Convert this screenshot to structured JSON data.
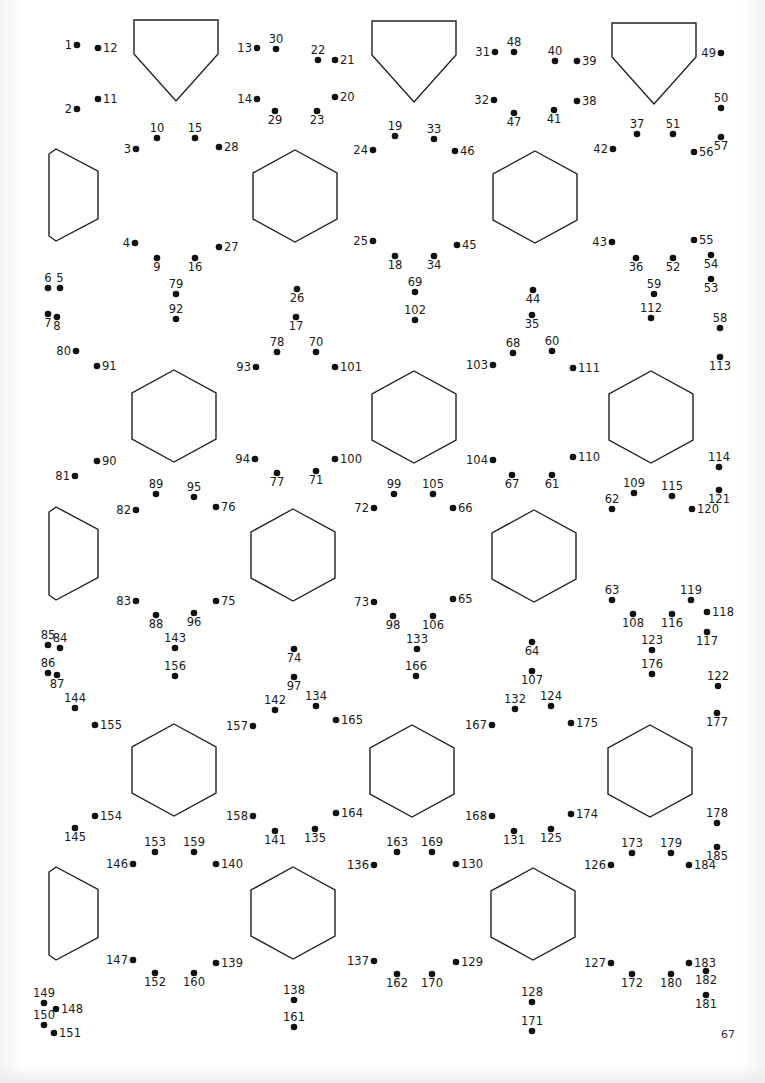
{
  "page": {
    "type": "connect-the-dots puzzle page",
    "page_number": "67",
    "ink_color": "#111111",
    "background_color": "#ffffff"
  },
  "outline_shapes": {
    "pentagons": 3,
    "half_hexagons_left_edge": 3,
    "hexagons": 12
  },
  "dots": [
    "1",
    "2",
    "3",
    "4",
    "5",
    "6",
    "7",
    "8",
    "9",
    "10",
    "11",
    "12",
    "13",
    "14",
    "15",
    "16",
    "17",
    "18",
    "19",
    "20",
    "21",
    "22",
    "23",
    "24",
    "25",
    "26",
    "27",
    "28",
    "29",
    "30",
    "31",
    "32",
    "33",
    "34",
    "35",
    "36",
    "37",
    "38",
    "39",
    "40",
    "41",
    "42",
    "43",
    "44",
    "45",
    "46",
    "47",
    "48",
    "49",
    "50",
    "51",
    "52",
    "53",
    "54",
    "55",
    "56",
    "57",
    "58",
    "59",
    "60",
    "61",
    "62",
    "63",
    "64",
    "65",
    "66",
    "67",
    "68",
    "69",
    "70",
    "71",
    "72",
    "73",
    "74",
    "75",
    "76",
    "77",
    "78",
    "79",
    "80",
    "81",
    "82",
    "83",
    "84",
    "85",
    "86",
    "87",
    "88",
    "89",
    "90",
    "91",
    "92",
    "93",
    "94",
    "95",
    "96",
    "97",
    "98",
    "99",
    "100",
    "101",
    "102",
    "103",
    "104",
    "105",
    "106",
    "107",
    "108",
    "109",
    "110",
    "111",
    "112",
    "113",
    "114",
    "115",
    "116",
    "117",
    "118",
    "119",
    "120",
    "121",
    "122",
    "123",
    "124",
    "125",
    "126",
    "127",
    "128",
    "129",
    "130",
    "131",
    "132",
    "133",
    "134",
    "135",
    "136",
    "137",
    "138",
    "139",
    "140",
    "141",
    "142",
    "143",
    "144",
    "145",
    "146",
    "147",
    "148",
    "149",
    "150",
    "151",
    "152",
    "153",
    "154",
    "155",
    "156",
    "157",
    "158",
    "159",
    "160",
    "161",
    "162",
    "163",
    "164",
    "165",
    "166",
    "167",
    "168",
    "169",
    "170",
    "171",
    "172",
    "173",
    "174",
    "175",
    "176",
    "177",
    "178",
    "179",
    "180",
    "181",
    "182",
    "183",
    "184",
    "185"
  ],
  "dot_count": 185
}
